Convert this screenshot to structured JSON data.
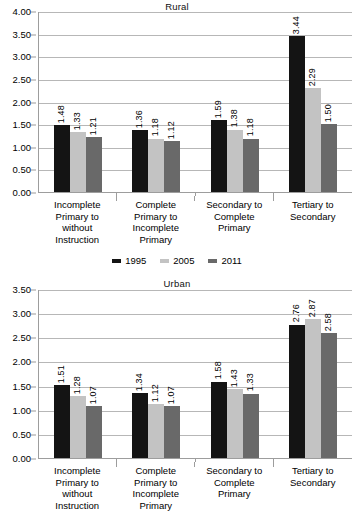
{
  "chart_data": [
    {
      "type": "bar",
      "title": "Rural",
      "xlabel": "",
      "ylabel": "",
      "ylim": [
        0,
        4.0
      ],
      "ytick_labels": [
        "0.00",
        "0.50",
        "1.00",
        "1.50",
        "2.00",
        "2.50",
        "3.00",
        "3.50",
        "4.00"
      ],
      "ytick_values": [
        0,
        0.5,
        1.0,
        1.5,
        2.0,
        2.5,
        3.0,
        3.5,
        4.0
      ],
      "grid": true,
      "legend_position": "bottom",
      "categories": [
        "Incomplete Primary to without Instruction",
        "Complete Primary to Incomplete Primary",
        "Secondary to Complete Primary",
        "Tertiary to Secondary"
      ],
      "category_lines": [
        [
          "Incomplete",
          "Primary to",
          "without",
          "Instruction"
        ],
        [
          "Complete",
          "Primary to",
          "Incomplete",
          "Primary"
        ],
        [
          "Secondary to",
          "Complete",
          "Primary"
        ],
        [
          "Tertiary to",
          "Secondary"
        ]
      ],
      "series": [
        {
          "name": "1995",
          "color": "#141414",
          "values": [
            1.48,
            1.36,
            1.59,
            3.44
          ],
          "labels": [
            "1.48",
            "1.36",
            "1.59",
            "3.44"
          ]
        },
        {
          "name": "2005",
          "color": "#c3c3c3",
          "values": [
            1.33,
            1.18,
            1.38,
            2.29
          ],
          "labels": [
            "1.33",
            "1.18",
            "1.38",
            "2.29"
          ]
        },
        {
          "name": "2011",
          "color": "#696969",
          "values": [
            1.21,
            1.12,
            1.18,
            1.5
          ],
          "labels": [
            "1.21",
            "1.12",
            "1.18",
            "1.50"
          ]
        }
      ]
    },
    {
      "type": "bar",
      "title": "Urban",
      "xlabel": "",
      "ylabel": "",
      "ylim": [
        0,
        3.5
      ],
      "ytick_labels": [
        "0.00",
        "0.50",
        "1.00",
        "1.50",
        "2.00",
        "2.50",
        "3.00",
        "3.50"
      ],
      "ytick_values": [
        0,
        0.5,
        1.0,
        1.5,
        2.0,
        2.5,
        3.0,
        3.5
      ],
      "grid": true,
      "legend_position": "none",
      "categories": [
        "Incomplete Primary to without Instruction",
        "Complete Primary to Incomplete Primary",
        "Secondary to Complete Primary",
        "Tertiary to Secondary"
      ],
      "category_lines": [
        [
          "Incomplete",
          "Primary to",
          "without",
          "Instruction"
        ],
        [
          "Complete",
          "Primary to",
          "Incomplete",
          "Primary"
        ],
        [
          "Secondary to",
          "Complete",
          "Primary"
        ],
        [
          "Tertiary to",
          "Secondary"
        ]
      ],
      "series": [
        {
          "name": "1995",
          "color": "#141414",
          "values": [
            1.51,
            1.34,
            1.58,
            2.76
          ],
          "labels": [
            "1.51",
            "1.34",
            "1.58",
            "2.76"
          ]
        },
        {
          "name": "2005",
          "color": "#c3c3c3",
          "values": [
            1.28,
            1.12,
            1.43,
            2.87
          ],
          "labels": [
            "1.28",
            "1.12",
            "1.43",
            "2.87"
          ]
        },
        {
          "name": "2011",
          "color": "#696969",
          "values": [
            1.07,
            1.07,
            1.33,
            2.58
          ],
          "labels": [
            "1.07",
            "1.07",
            "1.33",
            "2.58"
          ]
        }
      ]
    }
  ],
  "legend": {
    "items": [
      {
        "label": "1995",
        "color": "#141414"
      },
      {
        "label": "2005",
        "color": "#c3c3c3"
      },
      {
        "label": "2011",
        "color": "#696969"
      }
    ]
  }
}
